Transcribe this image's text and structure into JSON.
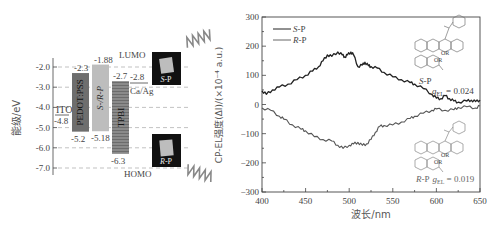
{
  "energy_diagram": {
    "ylabel": "能级/eV",
    "ticks": [
      "-2.0",
      "-3.0",
      "-4.0",
      "-5.0",
      "-6.0",
      "-7.0"
    ],
    "tick_values": [
      -2,
      -3,
      -4,
      -5,
      -6,
      -7
    ],
    "ito": {
      "label": "ITO",
      "value_label": "-4.8",
      "value": -4.8
    },
    "layers": [
      {
        "name": "PEDOT:PSS",
        "lumo": -2.3,
        "homo": -5.2,
        "lumo_label": "-2.3",
        "homo_label": "-5.2",
        "color": "#6e6e6e"
      },
      {
        "name": "S-/R-P",
        "lumo": -1.88,
        "homo": -5.18,
        "lumo_label": "-1.88",
        "homo_label": "-5.18",
        "color": "#bdbdbd"
      },
      {
        "name": "TPBI",
        "lumo": -2.7,
        "homo": -6.3,
        "lumo_label": "-2.7",
        "homo_label": "-6.3",
        "color": "#8a8a8a"
      }
    ],
    "cathode": {
      "label": "Ca/Ag",
      "value_label": "-2.8",
      "value": -2.8
    },
    "lumo_label": "LUMO",
    "homo_label": "HOMO",
    "photos": [
      {
        "label_italic": "S",
        "label_rest": "-P"
      },
      {
        "label_italic": "R",
        "label_rest": "-P"
      }
    ]
  },
  "chart_data": {
    "type": "line",
    "title": "",
    "xlabel": "波长/nm",
    "ylabel": "CP-EL强度(ΔI)/(×10⁻⁴ a.u.)",
    "xlim": [
      400,
      650
    ],
    "ylim": [
      -300,
      300
    ],
    "x_ticks": [
      "400",
      "450",
      "500",
      "550",
      "600",
      "650"
    ],
    "y_ticks": [
      "300",
      "200",
      "100",
      "0",
      "−100",
      "−200",
      "−300"
    ],
    "grid": false,
    "legend_position": "upper left",
    "series": [
      {
        "name": "S-P",
        "color": "#222222",
        "x": [
          400,
          405,
          412,
          420,
          430,
          440,
          450,
          458,
          465,
          470,
          475,
          480,
          487,
          492,
          495,
          498,
          502,
          505,
          510,
          515,
          518,
          522,
          525,
          532,
          540,
          550,
          560,
          570,
          575,
          585,
          595,
          600,
          605,
          610,
          615,
          620,
          625,
          635,
          640,
          645,
          650
        ],
        "y": [
          47,
          35,
          50,
          60,
          70,
          85,
          100,
          115,
          130,
          150,
          170,
          165,
          180,
          170,
          163,
          170,
          180,
          170,
          130,
          135,
          145,
          133,
          130,
          125,
          110,
          95,
          85,
          75,
          70,
          55,
          35,
          22,
          20,
          30,
          20,
          12,
          8,
          12,
          15,
          10,
          15
        ]
      },
      {
        "name": "R-P",
        "color": "#555555",
        "x": [
          400,
          410,
          420,
          425,
          435,
          445,
          450,
          460,
          470,
          480,
          487,
          493,
          500,
          505,
          510,
          515,
          520,
          525,
          530,
          535,
          540,
          550,
          560,
          570,
          575,
          585,
          595,
          600,
          610,
          620,
          625,
          635,
          645,
          650
        ],
        "y": [
          -12,
          -20,
          -40,
          -50,
          -70,
          -85,
          -90,
          -110,
          -120,
          -125,
          -140,
          -150,
          -140,
          -135,
          -130,
          -140,
          -135,
          -120,
          -95,
          -75,
          -72,
          -70,
          -60,
          -48,
          -40,
          -30,
          -20,
          -15,
          -20,
          -18,
          -10,
          -8,
          -12,
          -5
        ]
      }
    ],
    "legend": [
      {
        "italic": "S",
        "rest": "-P"
      },
      {
        "italic": "R",
        "rest": "-P"
      }
    ],
    "annotations": [
      {
        "italic": "S",
        "rest": "-P",
        "g_symbol": "g",
        "g_sub": "EL",
        "g_value": " = 0.024"
      },
      {
        "italic": "R",
        "rest": "-P",
        "g_symbol": "g",
        "g_sub": "EL",
        "g_value": " = 0.019"
      }
    ],
    "structure_labels": [
      "OR",
      "OR"
    ]
  }
}
